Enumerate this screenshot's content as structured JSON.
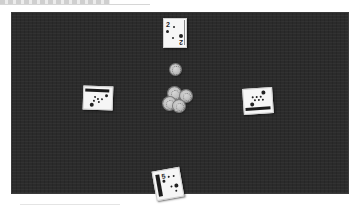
{
  "header": {
    "title": ""
  },
  "table": {
    "felt_color": "#2b2b2b",
    "cards": [
      {
        "position": "top",
        "rank": "2",
        "suit": "spades-icon",
        "rotation_deg": 0
      },
      {
        "position": "left",
        "rank": "",
        "suit": "clubs-icon",
        "rotation_deg": -90
      },
      {
        "position": "right",
        "rank": "",
        "suit": "spades-icon",
        "rotation_deg": 90
      },
      {
        "position": "bottom",
        "rank": "5",
        "suit": "spades-icon",
        "rotation_deg": -10
      }
    ],
    "chips": {
      "count": 5,
      "color": "#c4c4c4"
    }
  }
}
